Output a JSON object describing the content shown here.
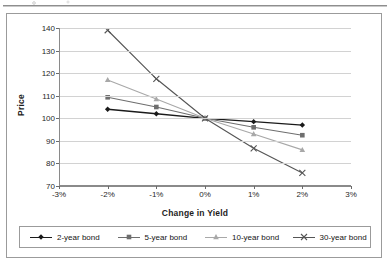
{
  "chart_data": {
    "type": "line",
    "title": "",
    "xlabel": "Change in Yield",
    "ylabel": "Price",
    "x": [
      -2,
      -1,
      0,
      1,
      2
    ],
    "xtick_labels": [
      "-3%",
      "-2%",
      "-1%",
      "0%",
      "1%",
      "2%",
      "3%"
    ],
    "xtick_values": [
      -3,
      -2,
      -1,
      0,
      1,
      2,
      3
    ],
    "xlim": [
      -3,
      3
    ],
    "ytick_labels": [
      "70",
      "80",
      "90",
      "100",
      "110",
      "120",
      "130",
      "140"
    ],
    "ytick_values": [
      70,
      80,
      90,
      100,
      110,
      120,
      130,
      140
    ],
    "ylim": [
      70,
      140
    ],
    "grid": "horizontal",
    "legend_position": "bottom",
    "series": [
      {
        "name": "2-year bond",
        "marker": "diamond",
        "color": "#1a1a1a",
        "values": [
          104.0,
          102.0,
          100.0,
          98.5,
          97.0
        ]
      },
      {
        "name": "5-year bond",
        "marker": "square",
        "color": "#6e6e6e",
        "values": [
          109.3,
          105.0,
          100.0,
          96.0,
          92.5
        ]
      },
      {
        "name": "10-year bond",
        "marker": "triangle",
        "color": "#a8a8a8",
        "values": [
          117.0,
          108.5,
          100.0,
          93.0,
          86.0
        ]
      },
      {
        "name": "30-year bond",
        "marker": "cross",
        "color": "#555555",
        "values": [
          139.0,
          117.5,
          100.0,
          86.7,
          75.8
        ]
      }
    ]
  },
  "figure": {
    "border_color": "#9b9b9b",
    "plot_background": "#ffffff",
    "gridline_color": "#d2d2d2",
    "axis_color": "#8a8a8a"
  }
}
